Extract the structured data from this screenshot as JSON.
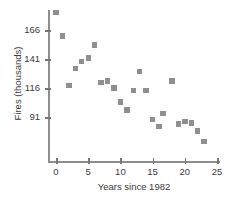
{
  "chart_data": {
    "type": "scatter",
    "title": "",
    "xlabel": "Years since 1982",
    "ylabel": "Fires (thousands)",
    "xlim": [
      -1.8,
      26.5
    ],
    "ylim": [
      62,
      184
    ],
    "xticks": [
      0,
      5,
      10,
      15,
      20,
      25
    ],
    "xtick_labels": [
      "0",
      "5",
      "10",
      "15",
      "20",
      "25"
    ],
    "yticks": [
      91,
      116,
      141,
      166
    ],
    "ytick_labels": [
      "91",
      "116",
      "141",
      "166"
    ],
    "grid": false,
    "legend": null,
    "marker": "square",
    "marker_color": "#8f8f8f",
    "axis_color": "#8d8d8d",
    "points": [
      {
        "x": 0,
        "y": 181
      },
      {
        "x": 1,
        "y": 161
      },
      {
        "x": 2,
        "y": 118
      },
      {
        "x": 3,
        "y": 133
      },
      {
        "x": 4,
        "y": 139
      },
      {
        "x": 5,
        "y": 142
      },
      {
        "x": 6,
        "y": 153
      },
      {
        "x": 7,
        "y": 121
      },
      {
        "x": 8,
        "y": 122
      },
      {
        "x": 9,
        "y": 116
      },
      {
        "x": 10,
        "y": 104
      },
      {
        "x": 11,
        "y": 97
      },
      {
        "x": 12,
        "y": 114
      },
      {
        "x": 13,
        "y": 130
      },
      {
        "x": 14,
        "y": 114
      },
      {
        "x": 15,
        "y": 89
      },
      {
        "x": 16,
        "y": 83
      },
      {
        "x": 16.6,
        "y": 94
      },
      {
        "x": 18,
        "y": 122
      },
      {
        "x": 19,
        "y": 85
      },
      {
        "x": 20,
        "y": 87
      },
      {
        "x": 21,
        "y": 86
      },
      {
        "x": 22,
        "y": 79
      },
      {
        "x": 23,
        "y": 70
      }
    ]
  }
}
